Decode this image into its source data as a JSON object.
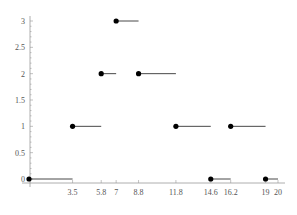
{
  "chart_data": {
    "type": "line",
    "subtype": "step",
    "title": "",
    "xlabel": "",
    "ylabel": "",
    "xlim": [
      0,
      20
    ],
    "ylim": [
      0,
      3
    ],
    "grid": false,
    "x_ticks": [
      "3.5",
      "5.8",
      "7",
      "8.8",
      "11.8",
      "14.6",
      "16.2",
      "19",
      "20"
    ],
    "x_tick_values": [
      3.5,
      5.8,
      7,
      8.8,
      11.8,
      14.6,
      16.2,
      19,
      20
    ],
    "y_ticks": [
      "0",
      "0.5",
      "1",
      "1.5",
      "2",
      "2.5",
      "3"
    ],
    "y_tick_values": [
      0,
      0.5,
      1,
      1.5,
      2,
      2.5,
      3
    ],
    "series": [
      {
        "name": "step",
        "color": "#000000",
        "steps": [
          {
            "x_start": 0,
            "x_end": 3.5,
            "y": 0
          },
          {
            "x_start": 3.5,
            "x_end": 5.8,
            "y": 1
          },
          {
            "x_start": 5.8,
            "x_end": 7,
            "y": 2
          },
          {
            "x_start": 7,
            "x_end": 8.8,
            "y": 3
          },
          {
            "x_start": 8.8,
            "x_end": 11.8,
            "y": 2
          },
          {
            "x_start": 11.8,
            "x_end": 14.6,
            "y": 1
          },
          {
            "x_start": 14.6,
            "x_end": 16.2,
            "y": 0
          },
          {
            "x_start": 16.2,
            "x_end": 19,
            "y": 1
          },
          {
            "x_start": 19,
            "x_end": 20,
            "y": 0
          }
        ]
      }
    ]
  }
}
